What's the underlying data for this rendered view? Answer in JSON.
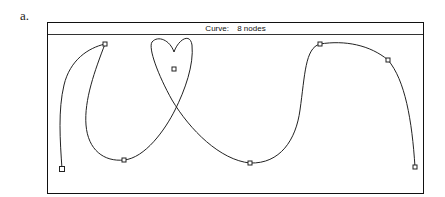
{
  "figure_label": "a.",
  "window": {
    "title_prefix": "Curve:",
    "title_value": "8 nodes"
  },
  "curve": {
    "node_count": 8,
    "nodes": [
      {
        "x": 62,
        "y": 169
      },
      {
        "x": 105,
        "y": 44
      },
      {
        "x": 124,
        "y": 160
      },
      {
        "x": 174,
        "y": 69
      },
      {
        "x": 250,
        "y": 163
      },
      {
        "x": 320,
        "y": 44
      },
      {
        "x": 388,
        "y": 60
      },
      {
        "x": 415,
        "y": 167
      }
    ],
    "stroke_color": "#222222"
  }
}
